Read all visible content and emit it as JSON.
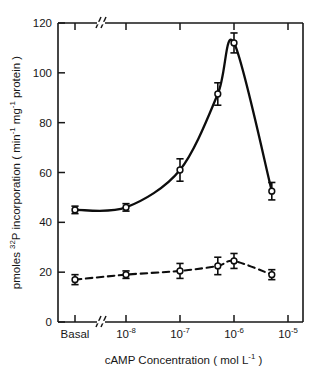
{
  "chart_data": {
    "type": "line",
    "title": "",
    "subtitle": "",
    "xlabel_parts": {
      "main": "cAMP Concentration",
      "units_open": "(",
      "units_text": "mol  L",
      "units_exp": "-1",
      "units_close": ")"
    },
    "xlabel": "cAMP Concentration (mol L-1)",
    "ylabel_parts": {
      "p1": "pmoles ",
      "sup1": "32",
      "p2": "P incorporation ( min",
      "sup2": "-1",
      "p3": "  mg",
      "sup3": "-1",
      "p4": "  protein )"
    },
    "ylabel": "pmoles 32P incorporation (min-1 mg-1 protein)",
    "x_tick_labels": [
      "Basal",
      "10-8",
      "10-7",
      "10-6",
      "10-5"
    ],
    "x_tick_display": [
      {
        "base": "Basal",
        "exp": ""
      },
      {
        "base": "10",
        "exp": "-8"
      },
      {
        "base": "10",
        "exp": "-7"
      },
      {
        "base": "10",
        "exp": "-6"
      },
      {
        "base": "10",
        "exp": "-5"
      }
    ],
    "y_tick_labels": [
      "0",
      "20",
      "40",
      "60",
      "80",
      "100",
      "120"
    ],
    "y_ticks": [
      0,
      20,
      40,
      60,
      80,
      100,
      120
    ],
    "ylim": [
      0,
      120
    ],
    "grid": false,
    "axis_break": true,
    "axis_break_note": "x-axis break between Basal and 10-8 decade",
    "legend_position": "none",
    "series": [
      {
        "name": "cAMP-stimulated (solid line, open circles)",
        "line_style": "solid",
        "marker": "open-circle",
        "x_labels": [
          "Basal",
          "1e-8",
          "1e-7",
          "5e-7",
          "1e-6",
          "5e-6"
        ],
        "x_exponents": [
          null,
          -8,
          -7,
          -6.3,
          -6,
          -5.3
        ],
        "values": [
          45,
          46,
          61,
          91.5,
          112,
          52.5
        ],
        "errors": [
          1.5,
          1.5,
          4.5,
          4.5,
          4,
          3.5
        ]
      },
      {
        "name": "Control (dashed line, open circles)",
        "line_style": "dashed",
        "marker": "open-circle",
        "x_labels": [
          "Basal",
          "1e-8",
          "1e-7",
          "5e-7",
          "1e-6",
          "5e-6"
        ],
        "x_exponents": [
          null,
          -8,
          -7,
          -6.3,
          -6,
          -5.3
        ],
        "values": [
          17,
          19,
          20.5,
          22.5,
          24.5,
          19
        ],
        "errors": [
          2,
          1.5,
          3,
          3.5,
          3,
          2
        ]
      }
    ],
    "colors": {
      "axis": "#171717",
      "solid_series": "#0d0d0d",
      "dashed_series": "#0d0d0d",
      "background": "#ffffff"
    }
  }
}
